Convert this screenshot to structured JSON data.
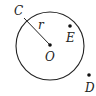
{
  "diagram": {
    "type": "geometry-circle",
    "circle": {
      "center_label": "O",
      "radius_label": "r",
      "cx": 50,
      "cy": 46,
      "radius": 34
    },
    "points": [
      {
        "label": "C",
        "x": 24,
        "y": 18,
        "position": "on circle"
      },
      {
        "label": "O",
        "x": 50,
        "y": 45,
        "position": "center"
      },
      {
        "label": "E",
        "x": 70,
        "y": 26,
        "position": "inside circle"
      },
      {
        "label": "D",
        "x": 89,
        "y": 75,
        "position": "outside circle"
      }
    ],
    "labels": {
      "C": "C",
      "O": "O",
      "E": "E",
      "D": "D",
      "r": "r"
    },
    "stroke_color": "#222222"
  }
}
